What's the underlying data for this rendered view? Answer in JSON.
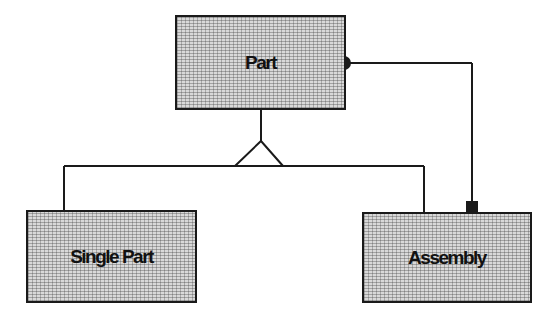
{
  "diagram": {
    "type": "entity-generalization",
    "nodes": [
      {
        "id": "part",
        "label": "Part"
      },
      {
        "id": "single_part",
        "label": "Single Part"
      },
      {
        "id": "assembly",
        "label": "Assembly"
      }
    ],
    "edges": [
      {
        "from": "part",
        "to": "single_part",
        "kind": "generalization"
      },
      {
        "from": "part",
        "to": "assembly",
        "kind": "generalization"
      },
      {
        "from": "part",
        "to": "assembly",
        "kind": "aggregation",
        "source_marker": "filled-circle",
        "target_marker": "filled-square"
      }
    ],
    "colors": {
      "line": "#1a1a1a",
      "fill": "#d9d9d9"
    }
  }
}
